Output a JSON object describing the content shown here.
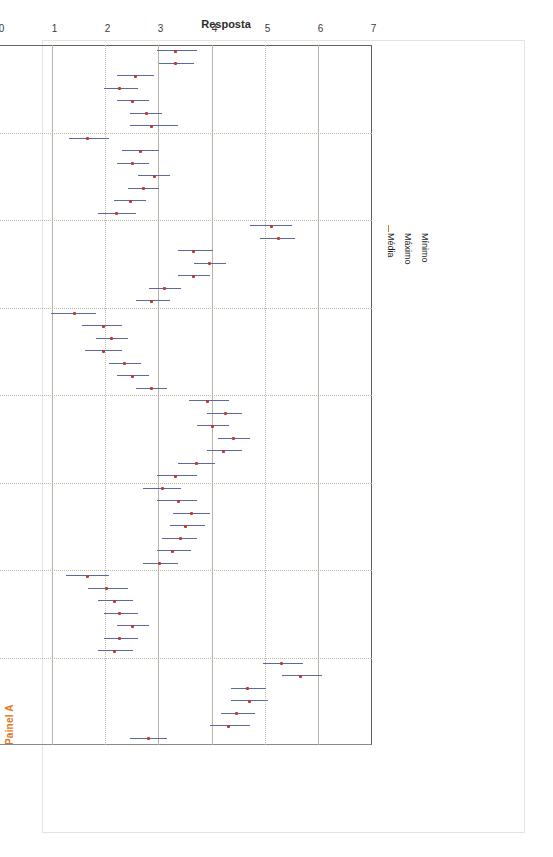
{
  "panel": {
    "label": "Painel A"
  },
  "top_caption": {
    "text": ""
  },
  "legend": {
    "items": [
      {
        "name": "minimo",
        "label": "Mínimo"
      },
      {
        "name": "maximo",
        "label": "Máximo"
      },
      {
        "name": "media",
        "label": "Média"
      }
    ]
  },
  "colors": {
    "range_line": "#5a6a9e",
    "mean_marker": "#C0392B",
    "panel_label": "#E0761B",
    "grid": "#b9b2a6",
    "axis": "#6b6257"
  },
  "chart_data": {
    "type": "line",
    "title": "",
    "subtitle": "",
    "xlabel": "Estrato socioeconômico",
    "ylabel": "Resposta",
    "ylim": [
      0,
      7
    ],
    "yticks": [
      0,
      1,
      2,
      3,
      4,
      5,
      6,
      7
    ],
    "grid": true,
    "grid_orientation": "horizontal",
    "legend_position": "top-left",
    "orientation": "rotated-90",
    "strata": [
      1,
      2,
      3,
      4,
      5,
      6,
      7
    ],
    "series": [
      {
        "name": "Mínimo",
        "style": "range-line-left-end"
      },
      {
        "name": "Máximo",
        "style": "range-line-right-end"
      },
      {
        "name": "Média",
        "style": "point-marker"
      }
    ],
    "categories": [
      {
        "label": "Ir ao teatro",
        "strata": [
          1,
          2,
          3,
          4,
          5,
          6,
          7
        ],
        "minimo": [
          2.95,
          3.0,
          2.2,
          1.95,
          2.2,
          2.45,
          2.45
        ],
        "maximo": [
          3.7,
          3.65,
          2.9,
          2.6,
          2.8,
          3.05,
          3.35
        ],
        "media": [
          3.3,
          3.3,
          2.55,
          2.25,
          2.5,
          2.75,
          2.85
        ]
      },
      {
        "label": "Jogar cartas",
        "strata": [
          1,
          2,
          3,
          4,
          5,
          6,
          7
        ],
        "minimo": [
          1.3,
          2.3,
          2.2,
          2.6,
          2.4,
          2.15,
          1.85
        ],
        "maximo": [
          2.05,
          3.0,
          2.8,
          3.2,
          3.0,
          2.75,
          2.55
        ],
        "media": [
          1.65,
          2.65,
          2.5,
          2.9,
          2.7,
          2.45,
          2.2
        ]
      },
      {
        "label": "Ler jornais",
        "strata": [
          1,
          2,
          3,
          4,
          5,
          6,
          7
        ],
        "minimo": [
          4.7,
          4.9,
          3.35,
          3.65,
          3.35,
          2.8,
          2.55
        ],
        "maximo": [
          5.5,
          5.55,
          4.0,
          4.25,
          3.95,
          3.4,
          3.2
        ],
        "media": [
          5.1,
          5.25,
          3.65,
          3.95,
          3.65,
          3.1,
          2.85
        ]
      },
      {
        "label": "Ir a exposições de artes",
        "strata": [
          1,
          2,
          3,
          4,
          5,
          6,
          7
        ],
        "minimo": [
          0.95,
          1.55,
          1.8,
          1.6,
          2.05,
          2.2,
          2.55
        ],
        "maximo": [
          1.8,
          2.3,
          2.4,
          2.3,
          2.65,
          2.8,
          3.15
        ],
        "media": [
          1.4,
          1.95,
          2.1,
          1.95,
          2.35,
          2.5,
          2.85
        ]
      },
      {
        "label": "Praticar algum esporte",
        "strata": [
          1,
          2,
          3,
          4,
          5,
          6,
          7
        ],
        "minimo": [
          3.55,
          3.9,
          3.7,
          4.1,
          3.9,
          3.35,
          2.95
        ],
        "maximo": [
          4.3,
          4.55,
          4.3,
          4.7,
          4.55,
          4.05,
          3.7
        ],
        "media": [
          3.9,
          4.25,
          4.0,
          4.4,
          4.2,
          3.7,
          3.3
        ]
      },
      {
        "label": "Ir a shows musicais",
        "strata": [
          1,
          2,
          3,
          4,
          5,
          6,
          7
        ],
        "minimo": [
          2.7,
          2.95,
          3.25,
          3.2,
          3.05,
          2.95,
          2.7
        ],
        "maximo": [
          3.4,
          3.7,
          3.95,
          3.85,
          3.7,
          3.6,
          3.35
        ],
        "media": [
          3.05,
          3.35,
          3.6,
          3.5,
          3.4,
          3.25,
          3.0
        ]
      },
      {
        "label": "Acampar",
        "strata": [
          1,
          2,
          3,
          4,
          5,
          6,
          7
        ],
        "minimo": [
          1.25,
          1.65,
          1.85,
          1.95,
          2.2,
          1.95,
          1.85
        ],
        "maximo": [
          2.05,
          2.4,
          2.5,
          2.6,
          2.8,
          2.6,
          2.5
        ],
        "media": [
          1.65,
          2.0,
          2.15,
          2.25,
          2.5,
          2.25,
          2.15
        ]
      },
      {
        "label": "Ler revistas",
        "strata": [
          1,
          2,
          3,
          4,
          5,
          6,
          7
        ],
        "minimo": [
          4.95,
          5.3,
          4.35,
          4.35,
          4.15,
          3.95,
          2.45
        ],
        "maximo": [
          5.7,
          6.05,
          5.0,
          5.05,
          4.8,
          4.7,
          3.15
        ],
        "media": [
          5.3,
          5.65,
          4.65,
          4.7,
          4.45,
          4.3,
          2.8
        ]
      }
    ]
  }
}
